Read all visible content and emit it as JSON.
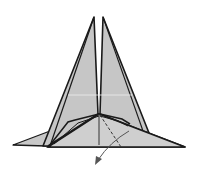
{
  "diagram": {
    "type": "origami-fold-step",
    "colors": {
      "paper": "#c8c8c8",
      "paper_light": "#d4d4d4",
      "outline": "#1a1a1a",
      "arrow": "#555555",
      "background": "#ffffff"
    },
    "elements": [
      {
        "name": "left-spike",
        "kind": "folded-flap"
      },
      {
        "name": "right-spike",
        "kind": "folded-flap"
      },
      {
        "name": "base-triangle",
        "kind": "paper-layer"
      },
      {
        "name": "left-wing",
        "kind": "paper-layer"
      },
      {
        "name": "valley-fold-line",
        "kind": "dashed-crease"
      },
      {
        "name": "fold-direction-arrow",
        "kind": "arrow"
      }
    ]
  }
}
